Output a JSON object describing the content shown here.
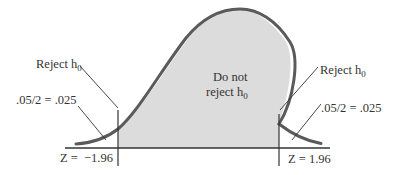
{
  "diagram": {
    "type": "two-tailed-normal-distribution",
    "colors": {
      "curve": "#5a5a5a",
      "fill": "#dcdcdc",
      "axis": "#333333",
      "text": "#333333",
      "background": "#ffffff"
    },
    "center_label": {
      "line1": "Do not",
      "line2": "reject h",
      "line2_sub": "0"
    },
    "left_tail": {
      "reject_label": "Reject h",
      "reject_sub": "0",
      "area_label": ".05/2 = .025",
      "z_label": "Z =  −1.96"
    },
    "right_tail": {
      "reject_label": "Reject h",
      "reject_sub": "0",
      "area_label": ".05/2 = .025",
      "z_label": "Z = 1.96"
    }
  }
}
